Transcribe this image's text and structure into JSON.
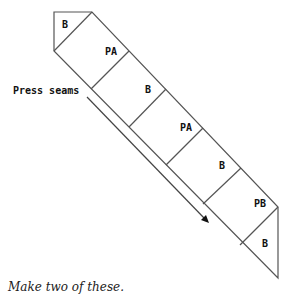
{
  "diagram": {
    "stroke_color": "#555555",
    "label_color": "#111111",
    "pieces": [
      {
        "label": "B",
        "x": 62,
        "y": 28
      },
      {
        "label": "PA",
        "x": 105,
        "y": 55
      },
      {
        "label": "B",
        "x": 145,
        "y": 93
      },
      {
        "label": "PA",
        "x": 180,
        "y": 131
      },
      {
        "label": "B",
        "x": 219,
        "y": 169
      },
      {
        "label": "PB",
        "x": 254,
        "y": 207
      },
      {
        "label": "B",
        "x": 262,
        "y": 247
      }
    ],
    "annotation": {
      "label": "Press seams",
      "arrow": "arrow-down-right"
    }
  },
  "caption": "Make two of these."
}
